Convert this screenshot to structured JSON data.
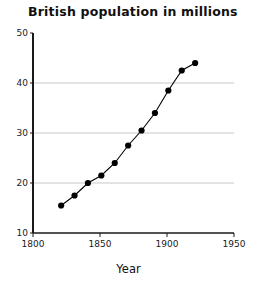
{
  "chart_data": {
    "type": "line",
    "title": "British population in millions",
    "xlabel": "Year",
    "ylabel": "",
    "xlim": [
      1800,
      1950
    ],
    "ylim": [
      10,
      50
    ],
    "xticks": [
      1800,
      1850,
      1900,
      1950
    ],
    "xtick_labels": [
      "1800",
      "1850",
      "1900",
      "1950"
    ],
    "yticks": [
      10,
      20,
      30,
      40,
      50
    ],
    "ytick_labels": [
      "10",
      "20",
      "30",
      "40",
      "50"
    ],
    "grid": "horizontal gridlines at 20, 30, 40",
    "gridlines_y": [
      20,
      30,
      40
    ],
    "legend": null,
    "marker": "filled-circle",
    "x": [
      1821,
      1831,
      1841,
      1851,
      1861,
      1871,
      1881,
      1891,
      1901,
      1911,
      1921
    ],
    "values": [
      15.5,
      17.5,
      20.0,
      21.5,
      24.0,
      27.5,
      30.5,
      34.0,
      38.5,
      42.5,
      44.0
    ],
    "series": [
      {
        "name": "British population",
        "x": [
          1821,
          1831,
          1841,
          1851,
          1861,
          1871,
          1881,
          1891,
          1901,
          1911,
          1921
        ],
        "values": [
          15.5,
          17.5,
          20.0,
          21.5,
          24.0,
          27.5,
          30.5,
          34.0,
          38.5,
          42.5,
          44.0
        ]
      }
    ]
  },
  "axis_colors": {
    "axis_line": "#1a1a1a",
    "gridline": "#c8c8c8",
    "marker": "#000000",
    "series_line": "#000000"
  }
}
